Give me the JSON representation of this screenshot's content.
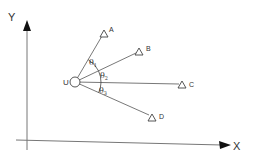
{
  "diagram": {
    "type": "angle-of-arrival geometry",
    "axes": {
      "x_label": "X",
      "y_label": "Y"
    },
    "origin_node": {
      "label": "U",
      "x": 75,
      "y": 82
    },
    "targets": [
      {
        "label": "A",
        "x": 104,
        "y": 33
      },
      {
        "label": "B",
        "x": 139,
        "y": 51
      },
      {
        "label": "C",
        "x": 182,
        "y": 84
      },
      {
        "label": "D",
        "x": 152,
        "y": 117
      }
    ],
    "angles": [
      {
        "symbol": "θ",
        "sub": "1",
        "between": [
          "A",
          "B"
        ]
      },
      {
        "symbol": "θ",
        "sub": "2",
        "between": [
          "B",
          "C"
        ]
      },
      {
        "symbol": "θ",
        "sub": "3",
        "between": [
          "C",
          "D"
        ]
      }
    ],
    "colors": {
      "line": "#555555",
      "axis": "#666666",
      "arrow": "#111111"
    }
  }
}
